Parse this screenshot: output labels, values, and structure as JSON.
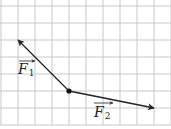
{
  "diagram": {
    "type": "vector-diagram",
    "grid": {
      "cell_size_px": 17,
      "origin_px": [
        1,
        6
      ],
      "columns": 10,
      "rows": 7,
      "line_color": "#c8c8c8"
    },
    "point": {
      "name": "application-point",
      "grid": [
        4,
        5
      ],
      "color": "#111111"
    },
    "vectors": [
      {
        "name": "F1",
        "symbol": "F",
        "subscript": "1",
        "from_grid": [
          4,
          5
        ],
        "to_grid": [
          1,
          2
        ],
        "components_cells": [
          -3,
          3
        ],
        "color": "#222222"
      },
      {
        "name": "F2",
        "symbol": "F",
        "subscript": "2",
        "from_grid": [
          4,
          5
        ],
        "to_grid": [
          9,
          6
        ],
        "components_cells": [
          5,
          -1
        ],
        "color": "#222222"
      }
    ]
  }
}
